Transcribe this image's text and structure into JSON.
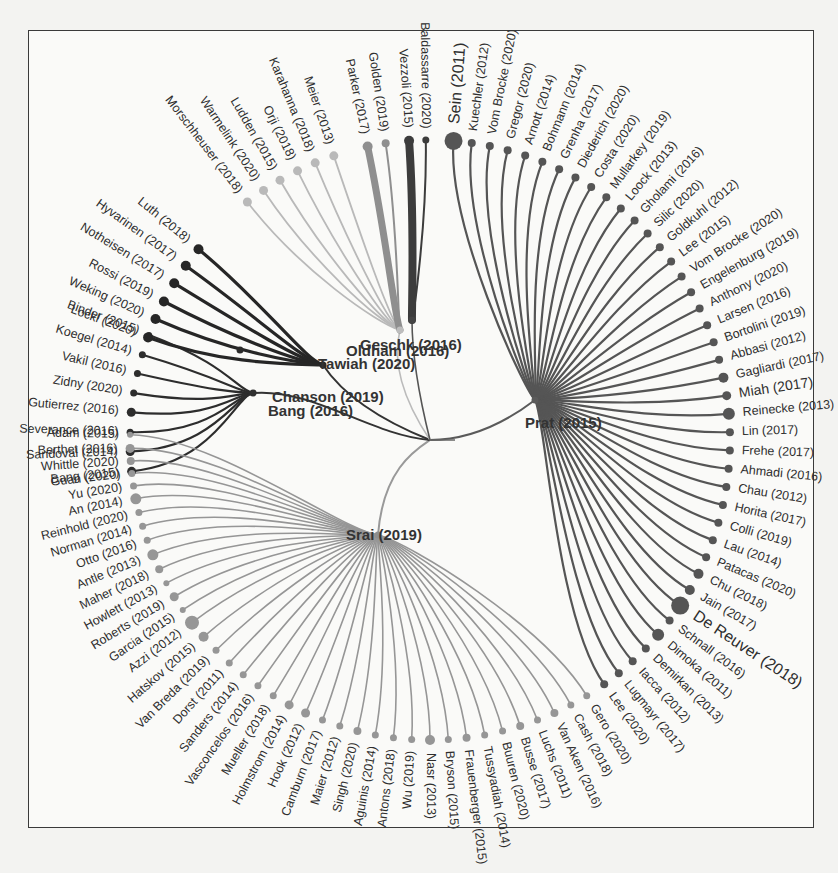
{
  "diagram": {
    "type": "radial-tree",
    "root": {
      "x": 430,
      "y": 440
    },
    "leaf_radius": 300,
    "label_gap": 8,
    "hubs": [
      {
        "id": "prat",
        "label": "Prat (2015)",
        "x": 535,
        "y": 400,
        "lx": 525,
        "ly": 428,
        "color": "#5a5a5a"
      },
      {
        "id": "srai",
        "label": "Srai (2019)",
        "x": 378,
        "y": 535,
        "lx": 346,
        "ly": 540,
        "color": "#8e8e8e"
      },
      {
        "id": "bang",
        "label": "Bang (2016)",
        "x": 253,
        "y": 393,
        "lx": 268,
        "ly": 416,
        "color": "#303030"
      },
      {
        "id": "chanson",
        "label": "Chanson (2019)",
        "x": 240,
        "y": 350,
        "lx": 272,
        "ly": 402,
        "color": "#2a2a2a",
        "label_only": false
      },
      {
        "id": "tawiah",
        "label": "Tawiah (2020)",
        "x": 323,
        "y": 365,
        "lx": 318,
        "ly": 369,
        "color": "#2a2a2a"
      },
      {
        "id": "oldham",
        "label": "Oldham (2016)",
        "x": 400,
        "y": 330,
        "lx": 346,
        "ly": 356,
        "color": "#bdbdbd"
      },
      {
        "id": "geschk",
        "label": "Geschk (2016)",
        "x": 412,
        "y": 320,
        "lx": 360,
        "ly": 350,
        "color": "#444"
      }
    ],
    "hub_text": {
      "chanson_label": "Chanson (2019)",
      "bang_label": "Bang (2016)"
    },
    "groups": [
      {
        "id": "bang-cluster",
        "hub": "bang",
        "color": "#2d2d2d",
        "width": 2.2,
        "leaves": [
          {
            "label": "Binder (2015)",
            "angle": 200.5,
            "size": 3
          },
          {
            "label": "Koegel (2014)",
            "angle": 196.5,
            "size": 3.5
          },
          {
            "label": "Vakil (2016)",
            "angle": 192.8,
            "size": 3.5
          },
          {
            "label": "Zidny (2020)",
            "angle": 189.0,
            "size": 3.5
          },
          {
            "label": "Gutierrez (2016)",
            "angle": 185.3,
            "size": 4.5
          },
          {
            "label": "Severance (2016)",
            "angle": 181.5,
            "size": 3.5
          },
          {
            "label": "Sandoval (2014)",
            "angle": 177.8,
            "size": 4.5
          },
          {
            "label": "Bang (2015)",
            "angle": 174.0,
            "size": 4.5
          }
        ]
      },
      {
        "id": "chanson-cluster",
        "hub": "tawiah",
        "color": "#262626",
        "width": 3.2,
        "leaves": [
          {
            "label": "Luth (2018)",
            "angle": 219.5,
            "size": 5
          },
          {
            "label": "Hyvarinen (2017)",
            "angle": 215.5,
            "size": 5
          },
          {
            "label": "Notheisen (2017)",
            "angle": 211.5,
            "size": 5
          },
          {
            "label": "Rossi (2019)",
            "angle": 207.5,
            "size": 5
          },
          {
            "label": "Weking (2020)",
            "angle": 203.8,
            "size": 5
          },
          {
            "label": "Lockl (2020)",
            "angle": 200.0,
            "size": 5
          }
        ]
      },
      {
        "id": "oldham-cluster",
        "hub": "oldham",
        "color": "#b9b9b9",
        "width": 1.8,
        "leaves": [
          {
            "label": "Morschheuser (2018)",
            "angle": 232.5,
            "size": 4.5
          },
          {
            "label": "Warmelink (2020)",
            "angle": 236.3,
            "size": 4.5
          },
          {
            "label": "Ludden (2015)",
            "angle": 240.0,
            "size": 4.5
          },
          {
            "label": "Orji (2018)",
            "angle": 243.8,
            "size": 4.5
          },
          {
            "label": "Karahanna (2018)",
            "angle": 247.5,
            "size": 4.5
          },
          {
            "label": "Meier (2013)",
            "angle": 251.3,
            "size": 4.5
          }
        ]
      },
      {
        "id": "parker-cluster",
        "hub": "oldham",
        "color": "#8f8f8f",
        "width": 7,
        "leaves": [
          {
            "label": "Parker (2017)",
            "angle": 258.0,
            "size": 5,
            "width": 7
          },
          {
            "label": "Golden (2019)",
            "angle": 261.5,
            "size": 4,
            "width": 2
          }
        ]
      },
      {
        "id": "geschk-cluster",
        "hub": "geschk",
        "color": "#3c3c3c",
        "width": 8,
        "leaves": [
          {
            "label": "Vezzoli (2015)",
            "angle": 266.0,
            "size": 5,
            "width": 8
          },
          {
            "label": "Baldassarre (2020)",
            "angle": 269.2,
            "size": 3.5,
            "width": 2
          }
        ]
      },
      {
        "id": "prat-cluster",
        "hub": "prat",
        "color": "#555555",
        "width": 2.2,
        "leaves": [
          {
            "label": "Sein (2011)",
            "angle": 274.5,
            "size": 9,
            "big": true
          },
          {
            "label": "Kuechler (2012)",
            "angle": 278.0,
            "size": 4
          },
          {
            "label": "Vom Brocke (2020)",
            "angle": 281.5,
            "size": 4
          },
          {
            "label": "Gregor (2020)",
            "angle": 285.0,
            "size": 4
          },
          {
            "label": "Arnott (2014)",
            "angle": 288.5,
            "size": 4
          },
          {
            "label": "Bohmann (2014)",
            "angle": 292.0,
            "size": 4
          },
          {
            "label": "Grenha (2017)",
            "angle": 295.5,
            "size": 4
          },
          {
            "label": "Diederich (2020)",
            "angle": 299.0,
            "size": 4
          },
          {
            "label": "Costa (2020)",
            "angle": 302.5,
            "size": 4
          },
          {
            "label": "Mullarkey (2019)",
            "angle": 306.0,
            "size": 4
          },
          {
            "label": "Loock (2013)",
            "angle": 309.5,
            "size": 4
          },
          {
            "label": "Gholami (2016)",
            "angle": 313.0,
            "size": 4
          },
          {
            "label": "Silic (2020)",
            "angle": 316.5,
            "size": 4
          },
          {
            "label": "Goldkuhl (2012)",
            "angle": 320.0,
            "size": 4
          },
          {
            "label": "Lee (2015)",
            "angle": 323.5,
            "size": 4
          },
          {
            "label": "Vom Brocke (2020)",
            "angle": 327.0,
            "size": 4
          },
          {
            "label": "Engelenburg (2019)",
            "angle": 330.5,
            "size": 4
          },
          {
            "label": "Anthony (2020)",
            "angle": 334.0,
            "size": 4
          },
          {
            "label": "Larsen (2016)",
            "angle": 337.5,
            "size": 4
          },
          {
            "label": "Bortolini (2019)",
            "angle": 341.0,
            "size": 4
          },
          {
            "label": "Abbasi (2012)",
            "angle": 344.5,
            "size": 4
          },
          {
            "label": "Gagliardi (2017)",
            "angle": 348.0,
            "size": 5
          },
          {
            "label": "Miah (2017)",
            "angle": 351.5,
            "size": 4.5,
            "medium": true
          },
          {
            "label": "Reinecke (2013)",
            "angle": 355.0,
            "size": 6
          },
          {
            "label": "Lin (2017)",
            "angle": 358.5,
            "size": 4
          },
          {
            "label": "Frehe (2017)",
            "angle": 2.0,
            "size": 4
          },
          {
            "label": "Ahmadi (2016)",
            "angle": 5.5,
            "size": 4
          },
          {
            "label": "Chau (2012)",
            "angle": 9.0,
            "size": 4
          },
          {
            "label": "Horita (2017)",
            "angle": 12.5,
            "size": 4
          },
          {
            "label": "Colli (2019)",
            "angle": 16.0,
            "size": 4
          },
          {
            "label": "Lau (2014)",
            "angle": 19.5,
            "size": 4
          },
          {
            "label": "Patacas (2020)",
            "angle": 23.0,
            "size": 4
          },
          {
            "label": "Chu (2018)",
            "angle": 26.5,
            "size": 5
          },
          {
            "label": "Jain (2017)",
            "angle": 30.0,
            "size": 5
          },
          {
            "label": "De Reuver (2018)",
            "angle": 33.5,
            "size": 9,
            "big": true
          },
          {
            "label": "Schnall (2016)",
            "angle": 37.0,
            "size": 4
          },
          {
            "label": "Dimoka (2011)",
            "angle": 40.5,
            "size": 6
          },
          {
            "label": "Demirkan (2013)",
            "angle": 44.0,
            "size": 4
          },
          {
            "label": "Iacca (2012)",
            "angle": 47.5,
            "size": 4
          },
          {
            "label": "Lugmayr (2017)",
            "angle": 51.0,
            "size": 4
          },
          {
            "label": "Lee (2020)",
            "angle": 54.5,
            "size": 4
          }
        ]
      },
      {
        "id": "srai-cluster",
        "hub": "srai",
        "color": "#969696",
        "width": 1.6,
        "leaves": [
          {
            "label": "Gero (2020)",
            "angle": 58.5,
            "size": 3.5
          },
          {
            "label": "Cash (2018)",
            "angle": 62.0,
            "size": 3.5
          },
          {
            "label": "Van Aken (2016)",
            "angle": 65.5,
            "size": 4
          },
          {
            "label": "Luchs (2011)",
            "angle": 69.0,
            "size": 3.5
          },
          {
            "label": "Busse (2017)",
            "angle": 72.5,
            "size": 4
          },
          {
            "label": "Buuren (2020)",
            "angle": 76.0,
            "size": 3.5
          },
          {
            "label": "Tussyadiah (2014)",
            "angle": 79.5,
            "size": 3.5
          },
          {
            "label": "Frauenberger (2015)",
            "angle": 83.0,
            "size": 4
          },
          {
            "label": "Bryson (2015)",
            "angle": 86.5,
            "size": 3.5
          },
          {
            "label": "Nasr (2013)",
            "angle": 90.0,
            "size": 5
          },
          {
            "label": "Wu (2019)",
            "angle": 93.5,
            "size": 3.5
          },
          {
            "label": "Antons (2018)",
            "angle": 97.0,
            "size": 3.5
          },
          {
            "label": "Aguinis (2014)",
            "angle": 100.5,
            "size": 3.5
          },
          {
            "label": "Singh (2020)",
            "angle": 104.0,
            "size": 4
          },
          {
            "label": "Maier (2012)",
            "angle": 107.5,
            "size": 3.5
          },
          {
            "label": "Camburn (2017)",
            "angle": 111.0,
            "size": 3.5
          },
          {
            "label": "Hook (2012)",
            "angle": 114.5,
            "size": 4.5
          },
          {
            "label": "Holmstrom (2014)",
            "angle": 118.0,
            "size": 4.5
          },
          {
            "label": "Mueller (2018)",
            "angle": 121.5,
            "size": 3.5
          },
          {
            "label": "Vasconcelos (2016)",
            "angle": 125.0,
            "size": 3.5
          },
          {
            "label": "Sanders (2014)",
            "angle": 128.5,
            "size": 3.5
          },
          {
            "label": "Dorst (2011)",
            "angle": 132.0,
            "size": 3.5
          },
          {
            "label": "Van Breda (2019)",
            "angle": 135.5,
            "size": 3.5
          },
          {
            "label": "Hatskov (2015)",
            "angle": 139.0,
            "size": 5
          },
          {
            "label": "Azzi (2012)",
            "angle": 142.5,
            "size": 7
          },
          {
            "label": "Garcia (2015)",
            "angle": 145.5,
            "size": 3
          },
          {
            "label": "Roberts (2019)",
            "angle": 148.5,
            "size": 4.5
          },
          {
            "label": "Howlett (2013)",
            "angle": 151.5,
            "size": 3
          },
          {
            "label": "Maher (2018)",
            "angle": 154.5,
            "size": 4
          },
          {
            "label": "Antle (2013)",
            "angle": 157.5,
            "size": 5.5
          },
          {
            "label": "Otto (2016)",
            "angle": 160.5,
            "size": 3.5
          },
          {
            "label": "Norman (2014)",
            "angle": 163.3,
            "size": 3.5
          },
          {
            "label": "Reinhold (2020)",
            "angle": 166.0,
            "size": 3.5
          },
          {
            "label": "An (2014)",
            "angle": 168.7,
            "size": 5.5
          },
          {
            "label": "Yu (2020)",
            "angle": 171.2,
            "size": 3.5
          },
          {
            "label": "Guan (2020)",
            "angle": 173.6,
            "size": 3.5
          },
          {
            "label": "Whittle (2020)",
            "angle": 176.0,
            "size": 4
          },
          {
            "label": "Berthet (2016)",
            "angle": 178.4,
            "size": 4.5
          },
          {
            "label": "Adam (2015)",
            "angle": 181.0,
            "size": 3
          }
        ]
      }
    ]
  }
}
